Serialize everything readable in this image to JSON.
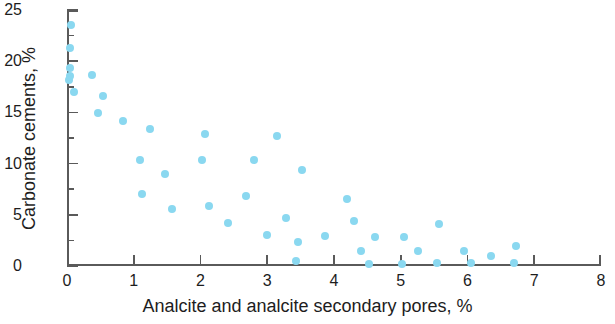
{
  "chart_data": {
    "type": "scatter",
    "title": "",
    "xlabel": "Analcite and analcite secondary pores, %",
    "ylabel": "Carbonate cements, %",
    "xlim": [
      0,
      8
    ],
    "ylim": [
      0,
      25
    ],
    "x_ticks": [
      0,
      1,
      2,
      3,
      4,
      5,
      6,
      7,
      8
    ],
    "y_ticks": [
      0,
      5,
      10,
      15,
      20,
      25
    ],
    "y_minor_ticks": [
      2.5,
      7.5,
      12.5,
      17.5,
      22.5
    ],
    "grid": false,
    "legend": null,
    "marker_color": "#8ad8f0",
    "axis_color": "#5a5a5a",
    "points": [
      {
        "x": 0.06,
        "y": 23.5
      },
      {
        "x": 0.05,
        "y": 21.3
      },
      {
        "x": 0.04,
        "y": 19.3
      },
      {
        "x": 0.05,
        "y": 18.6
      },
      {
        "x": 0.03,
        "y": 18.2
      },
      {
        "x": 0.37,
        "y": 18.7
      },
      {
        "x": 0.1,
        "y": 17.0
      },
      {
        "x": 0.54,
        "y": 16.6
      },
      {
        "x": 0.47,
        "y": 14.9
      },
      {
        "x": 0.84,
        "y": 14.2
      },
      {
        "x": 1.25,
        "y": 13.4
      },
      {
        "x": 2.06,
        "y": 12.9
      },
      {
        "x": 3.14,
        "y": 12.7
      },
      {
        "x": 1.1,
        "y": 10.4
      },
      {
        "x": 2.02,
        "y": 10.4
      },
      {
        "x": 2.8,
        "y": 10.4
      },
      {
        "x": 1.47,
        "y": 9.0
      },
      {
        "x": 3.52,
        "y": 9.4
      },
      {
        "x": 1.12,
        "y": 7.0
      },
      {
        "x": 2.68,
        "y": 6.8
      },
      {
        "x": 4.2,
        "y": 6.5
      },
      {
        "x": 1.58,
        "y": 5.6
      },
      {
        "x": 2.13,
        "y": 5.9
      },
      {
        "x": 3.28,
        "y": 4.7
      },
      {
        "x": 2.41,
        "y": 4.2
      },
      {
        "x": 4.3,
        "y": 4.4
      },
      {
        "x": 5.58,
        "y": 4.1
      },
      {
        "x": 3.0,
        "y": 3.0
      },
      {
        "x": 3.87,
        "y": 2.9
      },
      {
        "x": 4.62,
        "y": 2.8
      },
      {
        "x": 5.05,
        "y": 2.8
      },
      {
        "x": 6.72,
        "y": 2.0
      },
      {
        "x": 3.46,
        "y": 2.3
      },
      {
        "x": 4.41,
        "y": 1.5
      },
      {
        "x": 5.26,
        "y": 1.5
      },
      {
        "x": 5.95,
        "y": 1.5
      },
      {
        "x": 6.35,
        "y": 1.0
      },
      {
        "x": 3.43,
        "y": 0.5
      },
      {
        "x": 4.52,
        "y": 0.2
      },
      {
        "x": 5.02,
        "y": 0.2
      },
      {
        "x": 5.55,
        "y": 0.3
      },
      {
        "x": 6.05,
        "y": 0.3
      },
      {
        "x": 6.7,
        "y": 0.3
      }
    ]
  }
}
